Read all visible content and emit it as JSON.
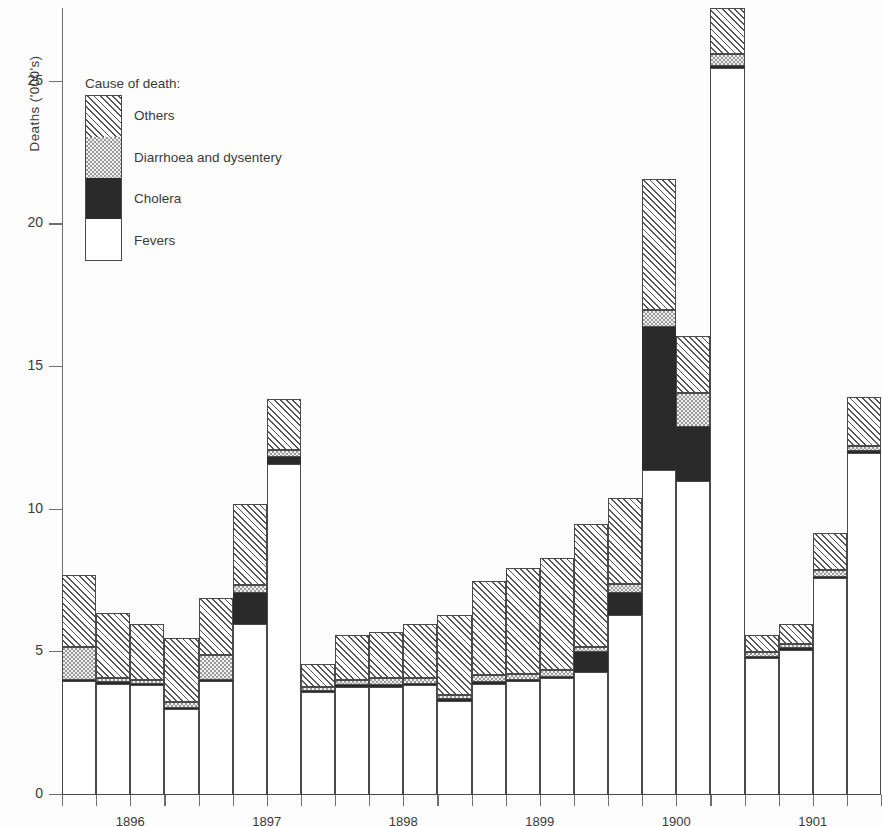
{
  "chart_data": {
    "type": "bar",
    "title": "",
    "subtitle": "",
    "xlabel": "",
    "ylabel": "Deaths ('000's)",
    "ylim": [
      0,
      27.6
    ],
    "yticks": [
      0,
      5,
      10,
      15,
      20,
      25
    ],
    "ytick_labels": [
      "0",
      "5",
      "10",
      "15",
      "20",
      "25"
    ],
    "grid": false,
    "stacked": true,
    "legend_position": "inside-top-left",
    "legend_title": "Cause of death:",
    "series": [
      {
        "name": "Fevers",
        "pattern": "white",
        "color": "#ffffff",
        "values": [
          4.0,
          3.9,
          3.85,
          3.0,
          4.0,
          6.0,
          11.6,
          3.6,
          3.8,
          3.8,
          3.85,
          3.3,
          3.9,
          4.0,
          4.1,
          4.3,
          6.3,
          11.4,
          11.0,
          25.5,
          4.8,
          5.1,
          7.6,
          12.0
        ]
      },
      {
        "name": "Cholera",
        "pattern": "solid-black",
        "color": "#2a2a2a",
        "values": [
          0.05,
          0.05,
          0.05,
          0.05,
          0.05,
          1.1,
          0.25,
          0.05,
          0.05,
          0.05,
          0.05,
          0.05,
          0.05,
          0.05,
          0.05,
          0.7,
          0.8,
          5.0,
          1.9,
          0.05,
          0.05,
          0.05,
          0.05,
          0.05
        ]
      },
      {
        "name": "Diarrhoea and dysentery",
        "pattern": "stipple",
        "color": "#f0f0f0",
        "values": [
          1.15,
          0.15,
          0.15,
          0.2,
          0.85,
          0.25,
          0.25,
          0.15,
          0.2,
          0.25,
          0.2,
          0.15,
          0.25,
          0.2,
          0.25,
          0.2,
          0.3,
          0.6,
          1.2,
          0.45,
          0.15,
          0.15,
          0.25,
          0.2
        ]
      },
      {
        "name": "Others",
        "pattern": "diagonal-hatch",
        "color": "#ffffff",
        "values": [
          2.5,
          2.3,
          1.95,
          2.25,
          2.0,
          2.85,
          1.8,
          0.8,
          1.55,
          1.6,
          1.9,
          2.8,
          3.3,
          3.7,
          3.9,
          4.3,
          3.0,
          4.6,
          2.0,
          1.6,
          0.6,
          0.7,
          1.3,
          1.7
        ]
      }
    ],
    "x_groups": [
      {
        "label": "1896",
        "bars": 4
      },
      {
        "label": "1897",
        "bars": 4
      },
      {
        "label": "1898",
        "bars": 4
      },
      {
        "label": "1899",
        "bars": 4
      },
      {
        "label": "1900",
        "bars": 4
      },
      {
        "label": "1901",
        "bars": 4
      }
    ],
    "totals": [
      7.7,
      6.4,
      6.0,
      5.5,
      6.9,
      10.2,
      13.9,
      4.6,
      5.6,
      5.7,
      6.0,
      6.3,
      7.5,
      7.95,
      8.3,
      9.5,
      10.4,
      21.6,
      16.1,
      27.6,
      5.6,
      6.0,
      9.2,
      13.95
    ]
  },
  "legend": {
    "title": "Cause of death:",
    "items": [
      {
        "label": "Others",
        "swatch": "diagonal-hatch"
      },
      {
        "label": "Diarrhoea and dysentery",
        "swatch": "stipple"
      },
      {
        "label": "Cholera",
        "swatch": "solid-black"
      },
      {
        "label": "Fevers",
        "swatch": "white"
      }
    ]
  },
  "axes": {
    "y_title": "Deaths ('000's)",
    "y_tick_labels": [
      "25",
      "20",
      "15",
      "10",
      "5",
      "0"
    ],
    "x_tick_labels": [
      "1896",
      "1897",
      "1898",
      "1899",
      "1900",
      "1901"
    ]
  },
  "colors": {
    "axis": "#6e6e6e",
    "outline": "#4a4a4a",
    "cholera": "#2a2a2a",
    "diarrhoea": "#f0f0f0",
    "background": "#ffffff"
  }
}
